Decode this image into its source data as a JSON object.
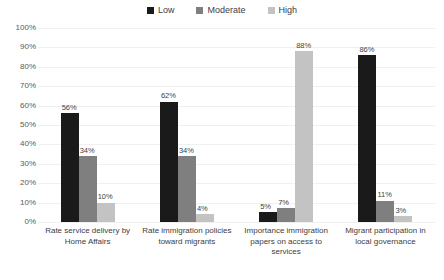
{
  "chart_data": {
    "type": "bar",
    "title": "",
    "xlabel": "",
    "ylabel": "",
    "ylim": [
      0,
      100
    ],
    "ytick_labels": [
      "100%",
      "90%",
      "80%",
      "70%",
      "60%",
      "50%",
      "40%",
      "30%",
      "20%",
      "10%",
      "0%"
    ],
    "ytick_values": [
      100,
      90,
      80,
      70,
      60,
      50,
      40,
      30,
      20,
      10,
      0
    ],
    "grid": true,
    "legend_position": "top-center",
    "categories": [
      "Rate service delivery by Home Affairs",
      "Rate immigration policies toward migrants",
      "Importance immigration papers on access to services",
      "Migrant participation in local governance"
    ],
    "series": [
      {
        "name": "Low",
        "color": "#1a1a1a",
        "values": [
          56,
          62,
          5,
          86
        ],
        "value_labels": [
          "56%",
          "62%",
          "5%",
          "86%"
        ]
      },
      {
        "name": "Moderate",
        "color": "#7f7f7f",
        "values": [
          34,
          34,
          7,
          11
        ],
        "value_labels": [
          "34%",
          "34%",
          "7%",
          "11%"
        ]
      },
      {
        "name": "High",
        "color": "#c3c3c3",
        "values": [
          10,
          4,
          88,
          3
        ],
        "value_labels": [
          "10%",
          "4%",
          "88%",
          "3%"
        ]
      }
    ]
  },
  "colors": {
    "background": "#ffffff",
    "gridline": "#f0f0f0",
    "text": "#404040",
    "tick_text": "#595959",
    "low": "#1a1a1a",
    "moderate": "#7f7f7f",
    "high": "#c3c3c3"
  }
}
